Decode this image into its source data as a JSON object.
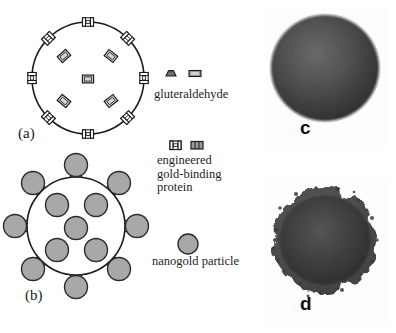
{
  "figure": {
    "caption_free": true,
    "width": 396,
    "height": 333,
    "background": "#ffffff"
  },
  "panels": {
    "a": {
      "tag": "(a)",
      "description": "schematic of protein-coated particle before nanogold attachment",
      "circle": {
        "cx": 88,
        "cy": 78,
        "r": 56,
        "fill": "#ffffff",
        "stroke": "#1c1c1c"
      },
      "surface_markers": 8,
      "interior_markers": 5
    },
    "b": {
      "tag": "(b)",
      "description": "schematic of particle decorated with nanogold particles",
      "circle": {
        "cx": 76,
        "cy": 226,
        "r": 49,
        "fill": "#ffffff",
        "stroke": "#1c1c1c"
      },
      "surface_linkers": 8,
      "attached_nanogold": 8,
      "interior_nanogold": 5
    },
    "c": {
      "tag": "c",
      "description": "TEM micrograph of smooth spherical particle",
      "box": {
        "x": 262,
        "y": 8,
        "w": 126,
        "h": 140
      }
    },
    "d": {
      "tag": "d",
      "description": "TEM micrograph of rough nanogold-decorated particle",
      "box": {
        "x": 262,
        "y": 178,
        "w": 126,
        "h": 148
      }
    }
  },
  "legend": {
    "gluteraldehyde": {
      "label": "gluteraldehyde",
      "icons": [
        "gluteraldehyde-dome-icon",
        "gluteraldehyde-bar-icon"
      ]
    },
    "protein": {
      "label": "engineered\ngold-binding\nprotein",
      "icons": [
        "protein-h-icon",
        "protein-bar-icon"
      ]
    },
    "nanogold": {
      "label": "nanogold particle",
      "icons": [
        "nanogold-circle-icon"
      ]
    }
  },
  "colors": {
    "ink": "#1c1c1c",
    "nanogold_fill": "#a8a8a8",
    "nanogold_stroke": "#2a2a2a",
    "marker_fill": "#d4d4d4",
    "panel_fill": "#ffffff",
    "micrograph_dark": "#3a3a3a",
    "micrograph_bg": "#fdfdfd"
  }
}
